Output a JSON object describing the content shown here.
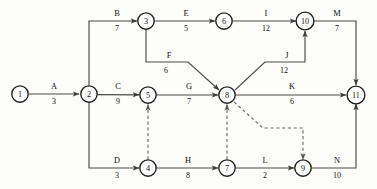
{
  "diagram": {
    "type": "directed-weighted-graph",
    "colors": {
      "background": "#fdfdfb",
      "edge": "#4a4a4a",
      "dashed_edge": "#6d6d6d",
      "node_stroke": "#1d1d1d",
      "node_fill": "#ffffff",
      "text": "#111111"
    },
    "nodes": [
      {
        "id": "1",
        "label": "1",
        "x": 20,
        "y": 94
      },
      {
        "id": "2",
        "label": "2",
        "x": 89,
        "y": 94
      },
      {
        "id": "3",
        "label": "3",
        "x": 146,
        "y": 21
      },
      {
        "id": "4",
        "label": "4",
        "x": 148,
        "y": 168
      },
      {
        "id": "5",
        "label": "5",
        "x": 148,
        "y": 95
      },
      {
        "id": "6",
        "label": "6",
        "x": 224,
        "y": 21
      },
      {
        "id": "7",
        "label": "7",
        "x": 227,
        "y": 168
      },
      {
        "id": "8",
        "label": "8",
        "x": 227,
        "y": 95
      },
      {
        "id": "9",
        "label": "9",
        "x": 303,
        "y": 168
      },
      {
        "id": "10",
        "label": "10",
        "x": 305,
        "y": 21
      },
      {
        "id": "11",
        "label": "11",
        "x": 356,
        "y": 95
      }
    ],
    "edges": [
      {
        "id": "A",
        "name": "A",
        "weight": "3",
        "from": "1",
        "to": "2",
        "label_x": 54,
        "label_y": 89,
        "weight_x": 54,
        "weight_y": 103,
        "style": "solid"
      },
      {
        "id": "B",
        "name": "B",
        "weight": "7",
        "from": "2",
        "to": "3",
        "label_x": 117,
        "label_y": 16,
        "weight_x": 117,
        "weight_y": 30,
        "style": "solid"
      },
      {
        "id": "C",
        "name": "C",
        "weight": "9",
        "from": "2",
        "to": "5",
        "label_x": 118,
        "label_y": 89,
        "weight_x": 118,
        "weight_y": 103,
        "style": "solid"
      },
      {
        "id": "D",
        "name": "D",
        "weight": "3",
        "from": "2",
        "to": "4",
        "label_x": 117,
        "label_y": 163,
        "weight_x": 117,
        "weight_y": 177,
        "style": "solid"
      },
      {
        "id": "E",
        "name": "E",
        "weight": "5",
        "from": "3",
        "to": "6",
        "label_x": 186,
        "label_y": 16,
        "weight_x": 186,
        "weight_y": 30,
        "style": "solid"
      },
      {
        "id": "F",
        "name": "F",
        "weight": "6",
        "from": "3",
        "to": "8",
        "label_x": 168,
        "label_y": 58,
        "weight_x": 166,
        "weight_y": 72,
        "style": "solid"
      },
      {
        "id": "G",
        "name": "G",
        "weight": "7",
        "from": "5",
        "to": "8",
        "label_x": 189,
        "label_y": 89,
        "weight_x": 189,
        "weight_y": 103,
        "style": "solid"
      },
      {
        "id": "H",
        "name": "H",
        "weight": "8",
        "from": "4",
        "to": "7",
        "label_x": 188,
        "label_y": 163,
        "weight_x": 188,
        "weight_y": 177,
        "style": "solid"
      },
      {
        "id": "I",
        "name": "I",
        "weight": "12",
        "from": "6",
        "to": "10",
        "label_x": 266,
        "label_y": 16,
        "weight_x": 266,
        "weight_y": 30,
        "style": "solid"
      },
      {
        "id": "J",
        "name": "J",
        "weight": "12",
        "from": "8",
        "to": "10",
        "label_x": 286,
        "label_y": 58,
        "weight_x": 284,
        "weight_y": 72,
        "style": "solid"
      },
      {
        "id": "K",
        "name": "K",
        "weight": "6",
        "from": "8",
        "to": "11",
        "label_x": 292,
        "label_y": 89,
        "weight_x": 292,
        "weight_y": 103,
        "style": "solid"
      },
      {
        "id": "L",
        "name": "L",
        "weight": "2",
        "from": "7",
        "to": "9",
        "label_x": 265,
        "label_y": 163,
        "weight_x": 265,
        "weight_y": 177,
        "style": "solid"
      },
      {
        "id": "M",
        "name": "M",
        "weight": "7",
        "from": "10",
        "to": "11",
        "label_x": 337,
        "label_y": 16,
        "weight_x": 337,
        "weight_y": 30,
        "style": "solid"
      },
      {
        "id": "N",
        "name": "N",
        "weight": "10",
        "from": "9",
        "to": "11",
        "label_x": 337,
        "label_y": 163,
        "weight_x": 337,
        "weight_y": 177,
        "style": "solid"
      }
    ],
    "dummy_edges": [
      {
        "id": "d1",
        "from": "4",
        "to": "5",
        "style": "dashed"
      },
      {
        "id": "d2",
        "from": "7",
        "to": "8",
        "style": "dashed"
      },
      {
        "id": "d3",
        "from": "8",
        "to": "9",
        "style": "dashed"
      }
    ]
  }
}
